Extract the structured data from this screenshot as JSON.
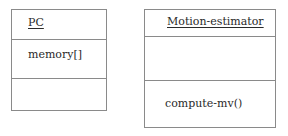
{
  "classes": [
    {
      "name": "PC",
      "attributes": [
        "memory[]"
      ],
      "operations": []
    },
    {
      "name": "Motion-estimator",
      "attributes": [],
      "operations": [
        "compute-mv()"
      ]
    }
  ]
}
